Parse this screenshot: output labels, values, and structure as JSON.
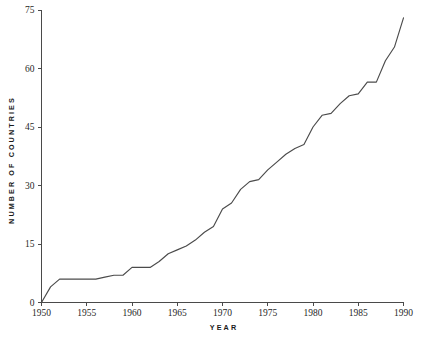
{
  "chart_data": {
    "type": "line",
    "title": "",
    "xlabel": "YEAR",
    "ylabel": "NUMBER OF COUNTRIES",
    "xlim": [
      1950,
      1990
    ],
    "ylim": [
      0,
      75
    ],
    "grid": false,
    "legend": false,
    "xticks": [
      1950,
      1955,
      1960,
      1965,
      1970,
      1975,
      1980,
      1985,
      1990
    ],
    "yticks": [
      0,
      15,
      30,
      45,
      60,
      75
    ],
    "x": [
      1950,
      1951,
      1952,
      1953,
      1954,
      1955,
      1956,
      1957,
      1958,
      1959,
      1960,
      1961,
      1962,
      1963,
      1964,
      1965,
      1966,
      1967,
      1968,
      1969,
      1970,
      1971,
      1972,
      1973,
      1974,
      1975,
      1976,
      1977,
      1978,
      1979,
      1980,
      1981,
      1982,
      1983,
      1984,
      1985,
      1986,
      1987,
      1988,
      1989
    ],
    "values": [
      0,
      4,
      6,
      6,
      6,
      6,
      6,
      6.5,
      7,
      7,
      9,
      9,
      9,
      10.5,
      12.5,
      13.5,
      14.5,
      16,
      18,
      19.5,
      24,
      25.5,
      29,
      31,
      31.5,
      34,
      36,
      38,
      39.5,
      40.5,
      45,
      48,
      48.5,
      51,
      53,
      53.5,
      56.5,
      56.5,
      62,
      65.5
    ],
    "final_value": 73,
    "series": [
      {
        "name": "Number of countries",
        "color": "#4b4b4b"
      }
    ],
    "xtick_labels": [
      "1950",
      "1955",
      "1960",
      "1965",
      "1970",
      "1975",
      "1980",
      "1985",
      "1990"
    ],
    "ytick_labels": [
      "0",
      "15",
      "30",
      "45",
      "60",
      "75"
    ]
  },
  "axes": {
    "x_title": "YEAR",
    "y_title": "NUMBER OF COUNTRIES"
  },
  "colors": {
    "line": "#4b4b4b",
    "axis": "#4a4a4a",
    "text": "#1a1a1a",
    "background": "#ffffff"
  }
}
